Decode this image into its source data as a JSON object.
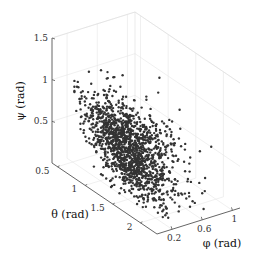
{
  "chart_data": {
    "type": "scatter3d",
    "title": "",
    "xlabel": "φ (rad)",
    "ylabel": "θ (rad)",
    "zlabel": "ψ (rad)",
    "x_ticks": [
      "0.2",
      "0.6",
      "1"
    ],
    "y_ticks": [
      "0.5",
      "1",
      "1.5",
      "2"
    ],
    "z_ticks": [
      "0.5",
      "1",
      "1.5"
    ],
    "xlim": [
      0,
      1.1
    ],
    "ylim": [
      0.4,
      2.3
    ],
    "zlim": [
      0,
      1.5
    ],
    "grid": true,
    "marker_color": "#333333",
    "marker_size": 1.2,
    "n_points_approx": 1500,
    "distribution": {
      "description": "Dense elongated cluster; psi mostly 0.1-1.1 with few outliers up to ~1.45; theta spread ~0.8-2.2; phi ~0.1-1.0, concentrated near low phi at high psi",
      "psi_range": [
        0.05,
        1.45
      ],
      "theta_range": [
        0.7,
        2.2
      ],
      "phi_range": [
        0.05,
        1.0
      ]
    }
  }
}
